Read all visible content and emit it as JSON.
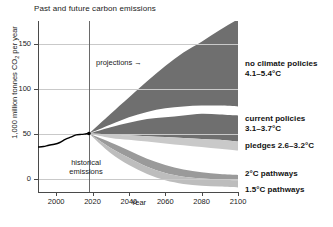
{
  "chart_data": {
    "type": "area",
    "title": "Past and future carbon emissions",
    "xlabel": "Year",
    "ylabel": "1,000 million tonnes CO2 per year",
    "xlim": [
      1990,
      2100
    ],
    "ylim": [
      -15,
      175
    ],
    "xticks": [
      2000,
      2020,
      2040,
      2060,
      2080,
      2100
    ],
    "yticks": [
      0,
      50,
      100,
      150
    ],
    "grid": true,
    "legend_position": "right-inline",
    "annotations": [
      {
        "text": "projections →",
        "x": 2022,
        "y": 137
      },
      {
        "text": "historical emissions",
        "x": 2002,
        "y": 28
      }
    ],
    "divider_year": 2018,
    "historical": {
      "name": "historical emissions",
      "x": [
        1990,
        1993,
        1996,
        1999,
        2002,
        2005,
        2008,
        2011,
        2014,
        2016,
        2018
      ],
      "values": [
        35,
        35.5,
        37,
        38,
        40,
        43.5,
        46,
        48.5,
        49,
        49.5,
        50
      ]
    },
    "series": [
      {
        "name": "no climate policies",
        "label": "no climate policies",
        "temperature": "4.1–5.4°C",
        "color": "#6f6f6f",
        "x": [
          2018,
          2030,
          2040,
          2050,
          2060,
          2070,
          2080,
          2090,
          2100
        ],
        "upper": [
          50,
          72,
          90,
          108,
          125,
          140,
          152,
          165,
          177
        ],
        "lower": [
          50,
          60,
          68,
          74,
          78,
          80,
          81,
          81,
          80
        ]
      },
      {
        "name": "current policies",
        "label": "current policies",
        "temperature": "3.1–3.7°C",
        "color": "#6f6f6f",
        "x": [
          2018,
          2030,
          2040,
          2050,
          2060,
          2070,
          2080,
          2090,
          2100
        ],
        "upper": [
          50,
          57,
          62,
          66,
          68,
          70,
          72,
          71,
          70
        ],
        "lower": [
          50,
          49,
          48,
          47,
          46,
          45,
          44,
          43,
          41
        ]
      },
      {
        "name": "pledges",
        "label": "pledges 2.6–3.2°C",
        "temperature": "2.6–3.2°C",
        "color": "#c9c9c9",
        "x": [
          2018,
          2030,
          2040,
          2050,
          2060,
          2070,
          2080,
          2090,
          2100
        ],
        "upper": [
          50,
          49,
          48,
          47,
          46,
          45,
          44,
          43,
          41
        ],
        "lower": [
          50,
          45,
          43,
          41,
          39,
          37,
          35,
          33,
          31
        ]
      },
      {
        "name": "2C pathways",
        "label": "2°C pathways",
        "temperature": "2°C",
        "color": "#9a9a9a",
        "x": [
          2018,
          2030,
          2040,
          2050,
          2060,
          2070,
          2080,
          2090,
          2100
        ],
        "upper": [
          50,
          40,
          31,
          22,
          15,
          10,
          7,
          5,
          4
        ],
        "lower": [
          50,
          34,
          23,
          13,
          6,
          2,
          0,
          -1,
          -2
        ]
      },
      {
        "name": "1.5C pathways",
        "label": "1.5°C pathways",
        "temperature": "1.5°C",
        "color": "#bdbdbd",
        "x": [
          2018,
          2030,
          2040,
          2050,
          2060,
          2070,
          2080,
          2090,
          2100
        ],
        "upper": [
          50,
          34,
          23,
          13,
          6,
          2,
          0,
          -1,
          -2
        ],
        "lower": [
          50,
          28,
          15,
          5,
          -2,
          -6,
          -8,
          -9,
          -10
        ]
      }
    ]
  },
  "axes": {
    "yticklabels": [
      "150",
      "100",
      "50",
      "0"
    ],
    "xticklabels": [
      "2000",
      "2020",
      "2040",
      "2060",
      "2080",
      "2100"
    ],
    "xaxis_name": "Year",
    "yaxis_name_pre": "1,000 million tonnes CO",
    "yaxis_name_sub": "2",
    "yaxis_name_post": " per year"
  },
  "labels": {
    "title": "Past and future carbon emissions",
    "projections": "projections →",
    "historical": "historical emissions",
    "noclimate_l1": "no climate policies",
    "noclimate_l2": "4.1–5.4°C",
    "current_l1": "current policies",
    "current_l2": "3.1–3.7°C",
    "pledges": "pledges 2.6–3.2°C",
    "twoc": "2°C pathways",
    "onefivec": "1.5°C pathways"
  },
  "colors": {
    "dark": "#6f6f6f",
    "mid": "#9a9a9a",
    "light_mid": "#bdbdbd",
    "light": "#c9c9c9",
    "grid": "#c9c9c9",
    "axis": "#4a4a4a",
    "line": "#000000"
  }
}
